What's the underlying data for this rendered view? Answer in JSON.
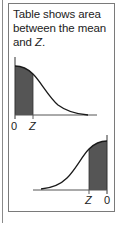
{
  "caption": {
    "line1": "Table shows area",
    "line2": "between the mean",
    "line3_prefix": "and ",
    "line3_var": "Z",
    "line3_suffix": "."
  },
  "upper_diagram": {
    "description": "Right half of normal curve, area shaded from 0 (mean) to Z",
    "left_label": "0",
    "right_label": "Z",
    "shade_color": "#555555"
  },
  "lower_diagram": {
    "description": "Left half of normal curve, area shaded from Z to 0 (mean)",
    "left_label": "Z",
    "right_label": "0",
    "shade_color": "#555555"
  },
  "colors": {
    "border": "#7a7a7a",
    "curve": "#1a1a1a",
    "shade": "#555555",
    "text": "#222222"
  }
}
